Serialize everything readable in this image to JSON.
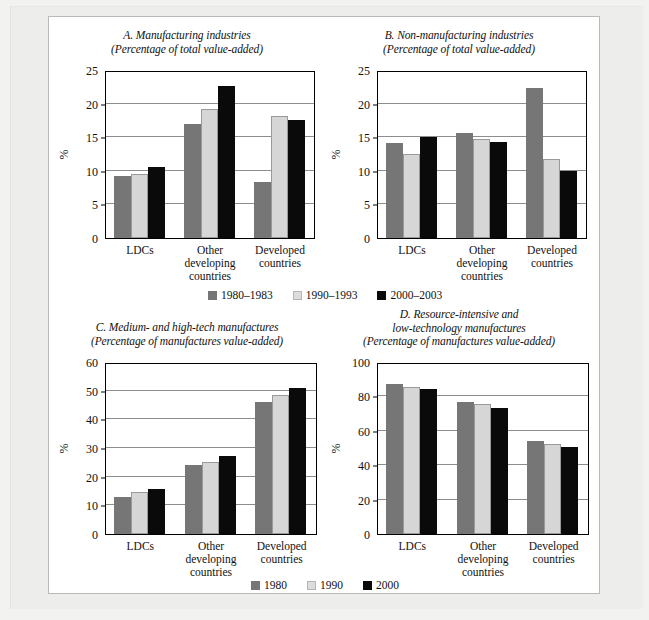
{
  "figure": {
    "panels": [
      {
        "id": "A",
        "title": "A. Manufacturing industries",
        "subtitle": "(Percentage of total value-added)",
        "ylabel": "%",
        "yticks": [
          0,
          5,
          10,
          15,
          20,
          25
        ],
        "ymin": 0,
        "ymax": 25,
        "categories": [
          "LDCs",
          "Other developing countries",
          "Developed countries"
        ],
        "series": [
          {
            "name": "1980–1983",
            "values": [
              9.2,
              16.9,
              8.4
            ]
          },
          {
            "name": "1990–1993",
            "values": [
              9.6,
              19.2,
              18.1
            ]
          },
          {
            "name": "2000–2003",
            "values": [
              10.5,
              22.6,
              17.5
            ]
          }
        ]
      },
      {
        "id": "B",
        "title": "B. Non-manufacturing industries",
        "subtitle": "(Percentage of total value-added)",
        "ylabel": "%",
        "yticks": [
          0,
          5,
          10,
          15,
          20,
          25
        ],
        "ymin": 0,
        "ymax": 25,
        "categories": [
          "LDCs",
          "Other developing countries",
          "Developed countries"
        ],
        "series": [
          {
            "name": "1980–1983",
            "values": [
              14.2,
              15.7,
              22.3
            ]
          },
          {
            "name": "1990–1993",
            "values": [
              12.5,
              14.8,
              11.7
            ]
          },
          {
            "name": "2000–2003",
            "values": [
              15.0,
              14.3,
              10.0
            ]
          }
        ]
      },
      {
        "id": "C",
        "title": "C. Medium- and high-tech manufactures",
        "subtitle": "(Percentage of manufactures value-added)",
        "ylabel": "%",
        "yticks": [
          0,
          10,
          20,
          30,
          40,
          50,
          60
        ],
        "ymin": 0,
        "ymax": 60,
        "categories": [
          "LDCs",
          "Other developing countries",
          "Developed countries"
        ],
        "series": [
          {
            "name": "1980",
            "values": [
              12.8,
              24.1,
              46.2
            ]
          },
          {
            "name": "1990",
            "values": [
              14.6,
              25.2,
              48.5
            ]
          },
          {
            "name": "2000",
            "values": [
              15.6,
              27.3,
              51.1
            ]
          }
        ]
      },
      {
        "id": "D",
        "title": "D. Resource-intensive and",
        "title2": "low-technology manufactures",
        "subtitle": "(Percentage of manufactures value-added)",
        "ylabel": "%",
        "yticks": [
          0,
          20,
          40,
          60,
          80,
          100
        ],
        "ymin": 0,
        "ymax": 100,
        "categories": [
          "LDCs",
          "Other developing countries",
          "Developed countries"
        ],
        "series": [
          {
            "name": "1980",
            "values": [
              87.5,
              77.0,
              54.0
            ]
          },
          {
            "name": "1990",
            "values": [
              85.7,
              75.3,
              52.3
            ]
          },
          {
            "name": "2000",
            "values": [
              84.5,
              73.0,
              50.4
            ]
          }
        ]
      }
    ],
    "legends": [
      {
        "id": "top",
        "items": [
          "1980–1983",
          "1990–1993",
          "2000–2003"
        ]
      },
      {
        "id": "bottom",
        "items": [
          "1980",
          "1990",
          "2000"
        ]
      }
    ],
    "colors": {
      "series_1": "#767676",
      "series_2": "#d6d6d6",
      "series_3": "#0a0a0a",
      "axis": "#000000",
      "grid": "#8d8d8d",
      "figure_border": "#b9b9b7",
      "background": "#ffffff"
    }
  },
  "chart_data": [
    {
      "type": "bar",
      "title": "A. Manufacturing industries",
      "subtitle": "(Percentage of total value-added)",
      "xlabel": "",
      "ylabel": "%",
      "ylim": [
        0,
        25
      ],
      "yticks": [
        0,
        5,
        10,
        15,
        20,
        25
      ],
      "grid": true,
      "legend_position": "below-figure-row-1",
      "categories": [
        "LDCs",
        "Other developing countries",
        "Developed countries"
      ],
      "series": [
        {
          "name": "1980–1983",
          "values": [
            9.2,
            16.9,
            8.4
          ]
        },
        {
          "name": "1990–1993",
          "values": [
            9.6,
            19.2,
            18.1
          ]
        },
        {
          "name": "2000–2003",
          "values": [
            10.5,
            22.6,
            17.5
          ]
        }
      ]
    },
    {
      "type": "bar",
      "title": "B. Non-manufacturing industries",
      "subtitle": "(Percentage of total value-added)",
      "xlabel": "",
      "ylabel": "%",
      "ylim": [
        0,
        25
      ],
      "yticks": [
        0,
        5,
        10,
        15,
        20,
        25
      ],
      "grid": true,
      "legend_position": "below-figure-row-1",
      "categories": [
        "LDCs",
        "Other developing countries",
        "Developed countries"
      ],
      "series": [
        {
          "name": "1980–1983",
          "values": [
            14.2,
            15.7,
            22.3
          ]
        },
        {
          "name": "1990–1993",
          "values": [
            12.5,
            14.8,
            11.7
          ]
        },
        {
          "name": "2000–2003",
          "values": [
            15.0,
            14.3,
            10.0
          ]
        }
      ]
    },
    {
      "type": "bar",
      "title": "C. Medium- and high-tech manufactures",
      "subtitle": "(Percentage of manufactures value-added)",
      "xlabel": "",
      "ylabel": "%",
      "ylim": [
        0,
        60
      ],
      "yticks": [
        0,
        10,
        20,
        30,
        40,
        50,
        60
      ],
      "grid": true,
      "legend_position": "below-figure-row-2",
      "categories": [
        "LDCs",
        "Other developing countries",
        "Developed countries"
      ],
      "series": [
        {
          "name": "1980",
          "values": [
            12.8,
            24.1,
            46.2
          ]
        },
        {
          "name": "1990",
          "values": [
            14.6,
            25.2,
            48.5
          ]
        },
        {
          "name": "2000",
          "values": [
            15.6,
            27.3,
            51.1
          ]
        }
      ]
    },
    {
      "type": "bar",
      "title": "D. Resource-intensive and low-technology manufactures",
      "subtitle": "(Percentage of manufactures value-added)",
      "xlabel": "",
      "ylabel": "%",
      "ylim": [
        0,
        100
      ],
      "yticks": [
        0,
        20,
        40,
        60,
        80,
        100
      ],
      "grid": true,
      "legend_position": "below-figure-row-2",
      "categories": [
        "LDCs",
        "Other developing countries",
        "Developed countries"
      ],
      "series": [
        {
          "name": "1980",
          "values": [
            87.5,
            77.0,
            54.0
          ]
        },
        {
          "name": "1990",
          "values": [
            85.7,
            75.3,
            52.3
          ]
        },
        {
          "name": "2000",
          "values": [
            84.5,
            73.0,
            50.4
          ]
        }
      ]
    }
  ]
}
